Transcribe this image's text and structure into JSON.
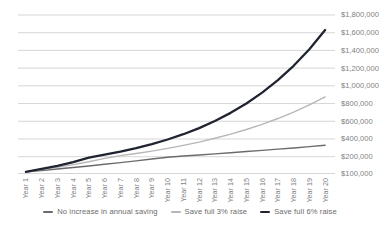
{
  "chart_data": {
    "type": "line",
    "title": "",
    "xlabel": "",
    "ylabel": "",
    "legend_position": "bottom",
    "grid": true,
    "y_axis_side": "right",
    "categories": [
      "Year 1",
      "Year 2",
      "Year 3",
      "Year 4",
      "Year 5",
      "Year 6",
      "Year 7",
      "Year 8",
      "Year 9",
      "Year 10",
      "Year 11",
      "Year 12",
      "Year 13",
      "Year 14",
      "Year 15",
      "Year 16",
      "Year 17",
      "Year 18",
      "Year 19",
      "Year 20"
    ],
    "y_ticks": [
      {
        "label": "$1,800,000",
        "value": 1800000
      },
      {
        "label": "$1,600,000",
        "value": 1600000
      },
      {
        "label": "$1,400,000",
        "value": 1400000
      },
      {
        "label": "$1,200,000",
        "value": 1200000
      },
      {
        "label": "$1,000,000",
        "value": 1000000
      },
      {
        "label": "$800,000",
        "value": 800000
      },
      {
        "label": "$600,000",
        "value": 600000
      },
      {
        "label": "$400,000",
        "value": 400000
      },
      {
        "label": "$200,000",
        "value": 200000
      },
      {
        "label": "$100,000",
        "value": 100000
      }
    ],
    "y_range": [
      100000,
      1800000
    ],
    "series": [
      {
        "name": "No increase in annual saving",
        "color": "#6b6b6b",
        "stroke_width": 1.4,
        "values": [
          110000,
          118000,
          127000,
          136000,
          145000,
          155000,
          165000,
          175000,
          186000,
          197000,
          208000,
          220000,
          232000,
          245000,
          258000,
          271000,
          285000,
          299000,
          314000,
          330000
        ]
      },
      {
        "name": "Save full 3% raise",
        "color": "#b7b7b7",
        "stroke_width": 1.4,
        "values": [
          110000,
          123000,
          137000,
          153000,
          170000,
          190000,
          212000,
          236000,
          263000,
          294000,
          328000,
          365000,
          408000,
          455000,
          507000,
          566000,
          631000,
          704000,
          785000,
          875000
        ]
      },
      {
        "name": "Save full 6% raise",
        "color": "#1f2430",
        "stroke_width": 2.3,
        "values": [
          110000,
          127000,
          146000,
          168000,
          194000,
          223000,
          257000,
          296000,
          342000,
          394000,
          454000,
          523000,
          603000,
          695000,
          801000,
          923000,
          1064000,
          1226000,
          1413000,
          1630000
        ]
      }
    ],
    "colors": {
      "gridline": "#cbcbcb",
      "axis_text": "#7f7f7f",
      "background": "#ffffff"
    }
  }
}
